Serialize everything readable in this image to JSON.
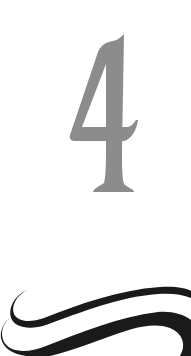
{
  "chapter": {
    "number": "4",
    "number_color": "#8c8c8c",
    "ornament": "swash-flourish",
    "ornament_color": "#1a1a1a"
  }
}
